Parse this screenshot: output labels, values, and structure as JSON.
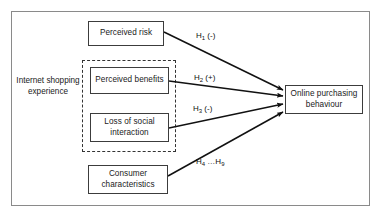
{
  "diagram": {
    "title_present": false,
    "context_label": "Internet shopping experience",
    "nodes": {
      "perceived_risk": "Perceived risk",
      "perceived_benefits": "Perceived benefits",
      "loss_of_social_interaction": "Loss of social interaction",
      "consumer_characteristics": "Consumer characteristics",
      "online_purchasing_behaviour": "Online purchasing behaviour"
    },
    "edges": [
      {
        "id": "h1",
        "from": "perceived_risk",
        "to": "online_purchasing_behaviour",
        "hypothesis": "H",
        "subscript": "1",
        "sign": "(-)"
      },
      {
        "id": "h2",
        "from": "perceived_benefits",
        "to": "online_purchasing_behaviour",
        "hypothesis": "H",
        "subscript": "2",
        "sign": "(+)"
      },
      {
        "id": "h3",
        "from": "loss_of_social_interaction",
        "to": "online_purchasing_behaviour",
        "hypothesis": "H",
        "subscript": "3",
        "sign": "(-)"
      },
      {
        "id": "h4_h9",
        "from": "consumer_characteristics",
        "to": "online_purchasing_behaviour",
        "hypothesis": "H",
        "subscript": "4",
        "sign": "",
        "range_to_hypothesis": "H",
        "range_to_subscript": "9",
        "separator": "…"
      }
    ],
    "edge_labels": {
      "h1_prefix": "H",
      "h1_sub": "1",
      "h1_suffix": " (-)",
      "h2_prefix": "H",
      "h2_sub": "2",
      "h2_suffix": " (+)",
      "h3_prefix": "H",
      "h3_sub": "3",
      "h3_suffix": " (-)",
      "h4_prefix": "H",
      "h4_sub": "4",
      "h4_mid": " …H",
      "h9_sub": "9"
    },
    "grouping": {
      "dashed_group_members": [
        "perceived_benefits",
        "loss_of_social_interaction"
      ],
      "dashed_group_style": "dashed"
    },
    "colors": {
      "frame_border": "#8a8a8a",
      "node_border": "#3c3c3c",
      "dashed_border": "#333333",
      "arrow": "#111111",
      "text": "#1a1a1a",
      "background": "#ffffff"
    }
  }
}
